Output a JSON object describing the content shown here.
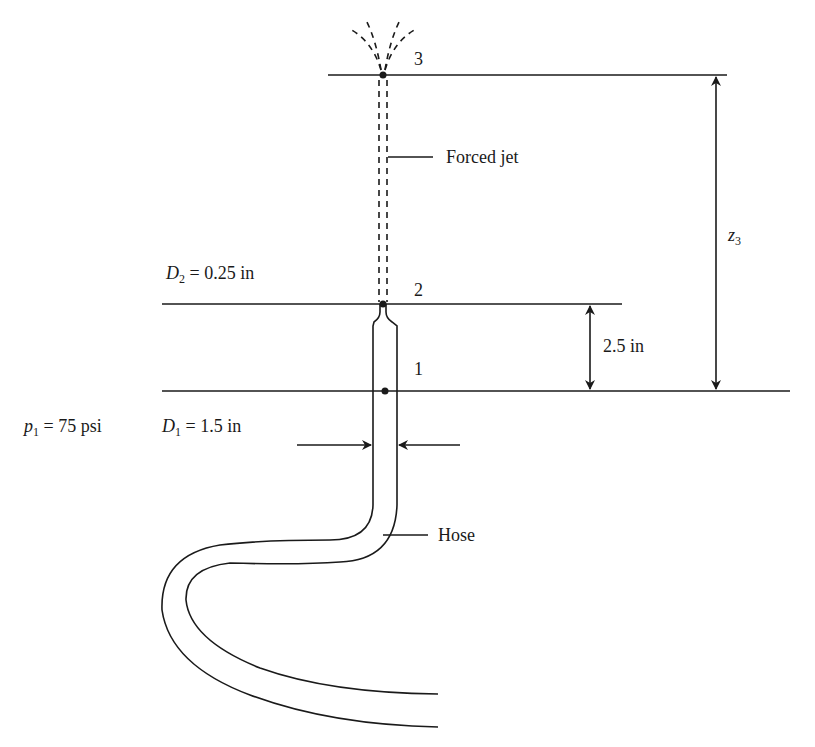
{
  "diagram": {
    "type": "fluid-mechanics-schematic",
    "stroke_color": "#1a1a1a",
    "labels": {
      "point3": "3",
      "point2": "2",
      "point1": "1",
      "forced_jet": "Forced jet",
      "hose": "Hose",
      "d2_symbol": "D",
      "d2_sub": "2",
      "d2_value": " = 0.25 in",
      "d1_symbol": "D",
      "d1_sub": "1",
      "d1_value": " = 1.5 in",
      "p1_symbol": "p",
      "p1_sub": "1",
      "p1_value": " = 75 psi",
      "dim_2_5": "2.5 in",
      "z3_symbol": "z",
      "z3_sub": "3"
    },
    "levels": {
      "level3_y": 75,
      "level2_y": 304,
      "level1_y": 391
    }
  }
}
